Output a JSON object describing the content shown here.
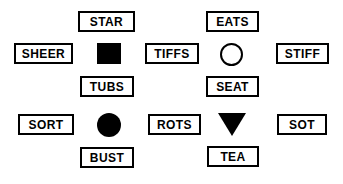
{
  "figure": {
    "background_color": "#ffffff",
    "stroke_color": "#000000",
    "width": 343,
    "height": 184
  },
  "clusters": [
    {
      "id": "left-cluster-square",
      "center_shape": {
        "name": "filled-square",
        "label": "square",
        "fill": "#000000"
      },
      "words": {
        "top": "STAR",
        "left": "SHEER",
        "right": "TIFFS",
        "bottom": "TUBS"
      }
    },
    {
      "id": "right-cluster-circle-outline",
      "center_shape": {
        "name": "outlined-circle",
        "label": "circle",
        "fill": "#ffffff"
      },
      "words": {
        "top": "EATS",
        "left": "TIFFS",
        "right": "STIFF",
        "bottom": "SEAT"
      }
    },
    {
      "id": "left-cluster-circle-filled",
      "center_shape": {
        "name": "filled-circle",
        "label": "circle",
        "fill": "#000000"
      },
      "words": {
        "top": "TUBS",
        "left": "SORT",
        "right": "ROTS",
        "bottom": "BUST"
      }
    },
    {
      "id": "right-cluster-triangle",
      "center_shape": {
        "name": "filled-triangle-down",
        "label": "triangle",
        "fill": "#000000"
      },
      "words": {
        "top": "SEAT",
        "left": "ROTS",
        "right": "SOT",
        "bottom": "TEA"
      }
    }
  ],
  "boxes": {
    "star": "STAR",
    "eats": "EATS",
    "sheer": "SHEER",
    "tiffs": "TIFFS",
    "stiff": "STIFF",
    "tubs": "TUBS",
    "seat": "SEAT",
    "sort": "SORT",
    "rots": "ROTS",
    "sot": "SOT",
    "bust": "BUST",
    "tea": "TEA"
  },
  "shapes": {
    "square": "filled-square",
    "circle_outline": "outlined-circle",
    "circle_filled": "filled-circle",
    "triangle": "filled-triangle-down"
  }
}
